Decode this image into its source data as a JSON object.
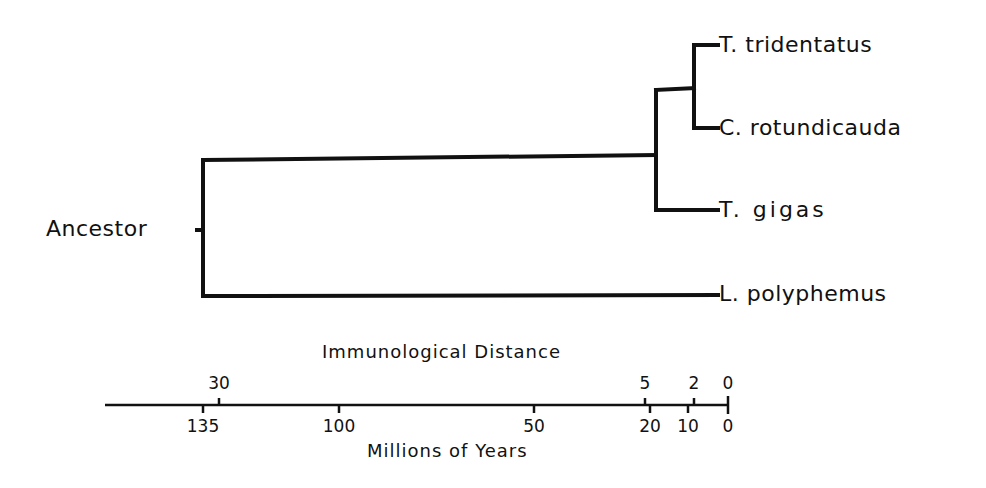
{
  "diagram": {
    "type": "phylogenetic-tree",
    "root_label": "Ancestor",
    "leaves": [
      {
        "label": "T. tridentatus",
        "y": 45
      },
      {
        "label": "C. rotundicauda",
        "y": 128
      },
      {
        "label": "T. gigas",
        "y": 210
      },
      {
        "label": "L. polyphemus",
        "y": 295
      }
    ],
    "line_color": "#111111"
  },
  "axis": {
    "top_title": "Immunological Distance",
    "bottom_title": "Millions of Years",
    "top_ticks": [
      {
        "label": "30",
        "x": 219
      },
      {
        "label": "5",
        "x": 645
      },
      {
        "label": "2",
        "x": 694
      },
      {
        "label": "0",
        "x": 728
      }
    ],
    "bottom_ticks": [
      {
        "label": "135",
        "x": 203
      },
      {
        "label": "100",
        "x": 339
      },
      {
        "label": "50",
        "x": 534
      },
      {
        "label": "20",
        "x": 650
      },
      {
        "label": "10",
        "x": 688
      },
      {
        "label": "0",
        "x": 728
      }
    ]
  }
}
